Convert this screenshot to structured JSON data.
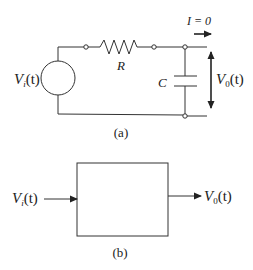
{
  "figure_a": {
    "caption": "(a)",
    "source_label": "V",
    "source_sub": "i",
    "source_arg": "(t)",
    "resistor_label": "R",
    "capacitor_label": "C",
    "current_label": "I = 0",
    "output_label": "V",
    "output_sub": "0",
    "output_arg": "(t)"
  },
  "figure_b": {
    "caption": "(b)",
    "input_label": "V",
    "input_sub": "i",
    "input_arg": "(t)",
    "output_label": "V",
    "output_sub": "0",
    "output_arg": "(t)"
  },
  "colors": {
    "line": "#333333",
    "background": "#ffffff"
  }
}
